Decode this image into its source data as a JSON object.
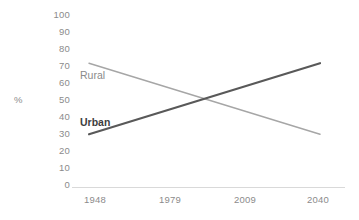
{
  "chart_data": {
    "type": "line",
    "title": "",
    "xlabel": "",
    "ylabel": "%",
    "x": [
      1948,
      1979,
      2009,
      2040
    ],
    "xtick_labels": [
      "1948",
      "1979",
      "2009",
      "2040"
    ],
    "ylim": [
      0,
      100
    ],
    "ytick_labels": [
      "100",
      "90",
      "80",
      "70",
      "60",
      "50",
      "40",
      "30",
      "20",
      "10",
      "0"
    ],
    "ytick_values": [
      100,
      90,
      80,
      70,
      60,
      50,
      40,
      30,
      20,
      10,
      0
    ],
    "grid": false,
    "legend_position": "inline-labels",
    "series": [
      {
        "name": "Rural",
        "label": "Rural",
        "color": "#a6a6a6",
        "linewidth": 1.4,
        "values": [
          70,
          56,
          43,
          30
        ],
        "endpoints": [
          {
            "x": 1948,
            "y": 70
          },
          {
            "x": 2040,
            "y": 30
          }
        ]
      },
      {
        "name": "Urban",
        "label": "Urban",
        "color": "#595959",
        "linewidth": 2.2,
        "values": [
          30,
          43,
          56,
          70
        ],
        "endpoints": [
          {
            "x": 1948,
            "y": 30
          },
          {
            "x": 2040,
            "y": 70
          }
        ]
      }
    ],
    "crossover": {
      "x": 1994,
      "y": 50
    },
    "axis_color": "#d9d9d9",
    "tick_text_color": "#8b8b8b"
  }
}
